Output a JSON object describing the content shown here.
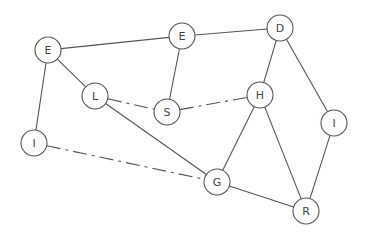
{
  "diagram": {
    "type": "undirected-graph",
    "node_radius": 13,
    "colors": {
      "stroke": "#555555",
      "label": "#444444",
      "fill": "#ffffff",
      "background": "#ffffff"
    },
    "nodes": [
      {
        "id": "E1",
        "label": "E",
        "x": 48,
        "y": 50
      },
      {
        "id": "E2",
        "label": "E",
        "x": 182,
        "y": 36
      },
      {
        "id": "D",
        "label": "D",
        "x": 280,
        "y": 28
      },
      {
        "id": "L",
        "label": "L",
        "x": 95,
        "y": 96
      },
      {
        "id": "S",
        "label": "S",
        "x": 167,
        "y": 112
      },
      {
        "id": "H",
        "label": "H",
        "x": 260,
        "y": 95
      },
      {
        "id": "I2",
        "label": "I",
        "x": 334,
        "y": 123
      },
      {
        "id": "I1",
        "label": "I",
        "x": 34,
        "y": 143
      },
      {
        "id": "G",
        "label": "G",
        "x": 217,
        "y": 182
      },
      {
        "id": "R",
        "label": "R",
        "x": 306,
        "y": 211
      }
    ],
    "edges": [
      {
        "from": "E1",
        "to": "E2",
        "style": "solid"
      },
      {
        "from": "E2",
        "to": "D",
        "style": "solid"
      },
      {
        "from": "E1",
        "to": "L",
        "style": "solid"
      },
      {
        "from": "E1",
        "to": "I1",
        "style": "solid"
      },
      {
        "from": "E2",
        "to": "S",
        "style": "solid"
      },
      {
        "from": "L",
        "to": "S",
        "style": "dashed"
      },
      {
        "from": "S",
        "to": "H",
        "style": "dashed"
      },
      {
        "from": "L",
        "to": "G",
        "style": "solid"
      },
      {
        "from": "I1",
        "to": "G",
        "style": "dashed"
      },
      {
        "from": "D",
        "to": "H",
        "style": "solid"
      },
      {
        "from": "D",
        "to": "I2",
        "style": "solid"
      },
      {
        "from": "H",
        "to": "G",
        "style": "solid"
      },
      {
        "from": "H",
        "to": "R",
        "style": "solid"
      },
      {
        "from": "I2",
        "to": "R",
        "style": "solid"
      },
      {
        "from": "G",
        "to": "R",
        "style": "solid"
      }
    ]
  }
}
